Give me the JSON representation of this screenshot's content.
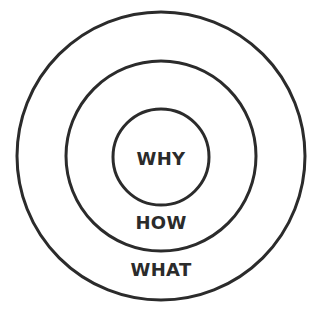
{
  "diagram": {
    "colors": {
      "stroke": "#2b2b2b",
      "background": "#ffffff"
    },
    "circles": [
      {
        "name": "outer",
        "label": "WHAT"
      },
      {
        "name": "middle",
        "label": "HOW"
      },
      {
        "name": "inner",
        "label": "WHY"
      }
    ]
  }
}
